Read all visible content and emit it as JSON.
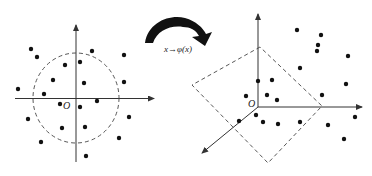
{
  "left_panel": {
    "origin_label": "O",
    "boundary": "dashed circle",
    "points": [
      [
        31,
        49
      ],
      [
        37,
        57
      ],
      [
        92,
        51
      ],
      [
        124,
        55
      ],
      [
        65,
        65
      ],
      [
        80,
        62
      ],
      [
        18,
        89
      ],
      [
        53,
        80
      ],
      [
        84,
        83
      ],
      [
        124,
        82
      ],
      [
        44,
        94
      ],
      [
        97,
        101
      ],
      [
        60,
        104
      ],
      [
        80,
        107
      ],
      [
        129,
        117
      ],
      [
        28,
        119
      ],
      [
        62,
        128
      ],
      [
        85,
        127
      ],
      [
        41,
        142
      ],
      [
        119,
        138
      ],
      [
        86,
        156
      ]
    ]
  },
  "mapping": {
    "label": "x→φ(x)",
    "arrow": "curved-arrow"
  },
  "right_panel": {
    "origin_label": "O",
    "boundary": "dashed plane",
    "points": [
      [
        297,
        30
      ],
      [
        321,
        35
      ],
      [
        318,
        45
      ],
      [
        317,
        51
      ],
      [
        348,
        56
      ],
      [
        300,
        68
      ],
      [
        258,
        81
      ],
      [
        272,
        80
      ],
      [
        346,
        84
      ],
      [
        246,
        96
      ],
      [
        267,
        95
      ],
      [
        277,
        100
      ],
      [
        322,
        95
      ],
      [
        256,
        115
      ],
      [
        263,
        122
      ],
      [
        278,
        124
      ],
      [
        300,
        122
      ],
      [
        328,
        125
      ],
      [
        355,
        117
      ],
      [
        344,
        139
      ],
      [
        239,
        121
      ]
    ]
  },
  "colors": {
    "ink": "#111111",
    "axis": "#333333",
    "dash": "#444444"
  }
}
